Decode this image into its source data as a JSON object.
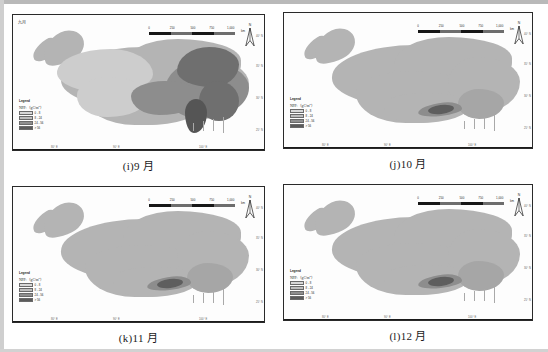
{
  "figure": {
    "kind": "four-panel-map-figure",
    "panels": [
      {
        "id": "i",
        "caption": "(i)9 月",
        "inner_tag": "九月",
        "scalebar": {
          "ticks": [
            "0",
            "250",
            "500",
            "750",
            "1,000"
          ],
          "unit": "km"
        },
        "north_arrow": {
          "letter": "N"
        },
        "legend": {
          "title": "Legend",
          "subtitle_text": "NPP:（gC/m",
          "subtitle_sup": "2",
          "subtitle_tail": "）",
          "classes": [
            {
              "label": "0 - 8",
              "color": "#d8d8d8"
            },
            {
              "label": "8 - 24",
              "color": "#bdbdbd"
            },
            {
              "label": "24 - 56",
              "color": "#8f8f8f"
            },
            {
              "label": "> 56",
              "color": "#5b5b5b"
            }
          ]
        },
        "lat_ticks": [
          "40° N",
          "35° N",
          "30° N",
          "25° N"
        ],
        "lon_ticks": [
          "80° E",
          "90° E",
          "100° E"
        ]
      },
      {
        "id": "j",
        "caption": "(j)10 月",
        "inner_tag": "",
        "scalebar": {
          "ticks": [
            "0",
            "250",
            "500",
            "750",
            "1,000"
          ],
          "unit": "km"
        },
        "north_arrow": {
          "letter": "N"
        },
        "legend": {
          "title": "Legend",
          "subtitle_text": "NPP:（gC/m",
          "subtitle_sup": "2",
          "subtitle_tail": "）",
          "classes": [
            {
              "label": "0 - 8",
              "color": "#d8d8d8"
            },
            {
              "label": "8 - 24",
              "color": "#bdbdbd"
            },
            {
              "label": "24 - 56",
              "color": "#8f8f8f"
            },
            {
              "label": "> 56",
              "color": "#5b5b5b"
            }
          ]
        },
        "lat_ticks": [
          "40° N",
          "35° N",
          "30° N",
          "25° N"
        ],
        "lon_ticks": [
          "80° E",
          "90° E",
          "100° E"
        ]
      },
      {
        "id": "k",
        "caption": "(k)11 月",
        "inner_tag": "",
        "scalebar": {
          "ticks": [
            "0",
            "250",
            "500",
            "750",
            "1,000"
          ],
          "unit": "km"
        },
        "north_arrow": {
          "letter": "N"
        },
        "legend": {
          "title": "Legend",
          "subtitle_text": "NPP:（gC/m",
          "subtitle_sup": "2",
          "subtitle_tail": "）",
          "classes": [
            {
              "label": "0 - 8",
              "color": "#d8d8d8"
            },
            {
              "label": "8 - 24",
              "color": "#bdbdbd"
            },
            {
              "label": "24 - 56",
              "color": "#8f8f8f"
            },
            {
              "label": "> 56",
              "color": "#5b5b5b"
            }
          ]
        },
        "lat_ticks": [
          "40° N",
          "35° N",
          "30° N",
          "25° N"
        ],
        "lon_ticks": [
          "80° E",
          "90° E",
          "100° E"
        ]
      },
      {
        "id": "l",
        "caption": "(l)12 月",
        "inner_tag": "",
        "scalebar": {
          "ticks": [
            "0",
            "250",
            "500",
            "750",
            "1,000"
          ],
          "unit": "km"
        },
        "north_arrow": {
          "letter": "N"
        },
        "legend": {
          "title": "Legend",
          "subtitle_text": "NPP:（gC/m",
          "subtitle_sup": "2",
          "subtitle_tail": "）",
          "classes": [
            {
              "label": "0 - 8",
              "color": "#d8d8d8"
            },
            {
              "label": "8 - 24",
              "color": "#bdbdbd"
            },
            {
              "label": "24 - 56",
              "color": "#8f8f8f"
            },
            {
              "label": "> 56",
              "color": "#5b5b5b"
            }
          ]
        },
        "lat_ticks": [
          "40° N",
          "35° N",
          "30° N",
          "25° N"
        ],
        "lon_ticks": [
          "80° E",
          "90° E",
          "100° E"
        ]
      }
    ]
  }
}
